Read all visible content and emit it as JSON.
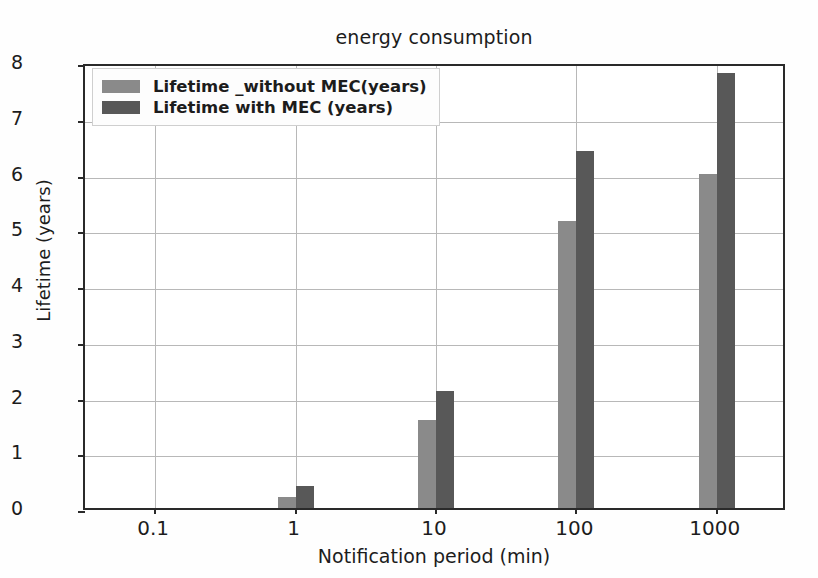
{
  "chart_data": {
    "type": "bar",
    "title": "energy consumption",
    "xlabel": "Notification period (min)",
    "ylabel": "Lifetime (years)",
    "categories": [
      "0.1",
      "1",
      "10",
      "100",
      "1000"
    ],
    "series": [
      {
        "name": "Lifetime _without MEC(years)",
        "color": "#8a8a8a",
        "values": [
          0,
          0.2,
          1.57,
          5.15,
          6.0
        ]
      },
      {
        "name": "Lifetime with MEC (years)",
        "color": "#585858",
        "values": [
          0,
          0.4,
          2.1,
          6.4,
          7.8
        ]
      }
    ],
    "ylim": [
      0,
      8
    ],
    "yticks": [
      0,
      1,
      2,
      3,
      4,
      5,
      6,
      7,
      8
    ],
    "ytick_labels": [
      "0",
      "1",
      "2",
      "3",
      "4",
      "5",
      "6",
      "7",
      "8"
    ],
    "xtick_labels": [
      "0.1",
      "1",
      "10",
      "100",
      "1000"
    ],
    "grid": true,
    "legend_position": "upper left",
    "background_color": "#ffffff",
    "axis_color": "#2a2a2a",
    "grid_color": "#b8b8b8"
  }
}
